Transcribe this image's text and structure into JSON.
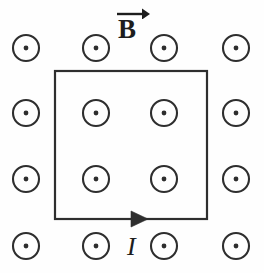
{
  "figure": {
    "name": "current-carrying-square-loop-in-uniform-magnetic-field",
    "width": 264,
    "height": 273,
    "background_color": "#fefefe",
    "ink_color": "#2e2e2e",
    "text_color": "#1d1d1d"
  },
  "labels": {
    "magnetic_field": "B",
    "magnetic_field_icon": "vector-arrow-overline",
    "current": "I"
  },
  "field_label_position": {
    "x": 132,
    "y": 28
  },
  "current_label_position": {
    "x": 134,
    "y": 248
  },
  "loop": {
    "shape": "square",
    "left": 55,
    "top": 71,
    "right": 207,
    "bottom": 219,
    "stroke_width": 2.2,
    "current_direction": "clockwise-arrow-on-bottom-edge-pointing-right",
    "arrowhead": {
      "tip_x": 148,
      "y": 219,
      "half_height": 8,
      "length": 17
    }
  },
  "field_symbol": {
    "type": "dot-in-circle",
    "meaning": "magnetic-field-out-of-page",
    "outer_radius": 13,
    "inner_radius": 2.4,
    "columns_x": [
      26,
      96,
      164,
      236
    ],
    "rows_y": [
      48,
      113,
      179,
      246
    ],
    "count": 16,
    "inside_loop_count": 4,
    "outside_loop_count": 12
  },
  "field_dots": [
    {
      "id": "dot-r1c1",
      "x": 26,
      "y": 48,
      "inside_loop": false
    },
    {
      "id": "dot-r1c2",
      "x": 96,
      "y": 48,
      "inside_loop": false
    },
    {
      "id": "dot-r1c3",
      "x": 164,
      "y": 48,
      "inside_loop": false
    },
    {
      "id": "dot-r1c4",
      "x": 236,
      "y": 48,
      "inside_loop": false
    },
    {
      "id": "dot-r2c1",
      "x": 26,
      "y": 113,
      "inside_loop": false
    },
    {
      "id": "dot-r2c2",
      "x": 96,
      "y": 113,
      "inside_loop": true
    },
    {
      "id": "dot-r2c3",
      "x": 164,
      "y": 113,
      "inside_loop": true
    },
    {
      "id": "dot-r2c4",
      "x": 236,
      "y": 113,
      "inside_loop": false
    },
    {
      "id": "dot-r3c1",
      "x": 26,
      "y": 179,
      "inside_loop": false
    },
    {
      "id": "dot-r3c2",
      "x": 96,
      "y": 179,
      "inside_loop": true
    },
    {
      "id": "dot-r3c3",
      "x": 164,
      "y": 179,
      "inside_loop": true
    },
    {
      "id": "dot-r3c4",
      "x": 236,
      "y": 179,
      "inside_loop": false
    },
    {
      "id": "dot-r4c1",
      "x": 26,
      "y": 246,
      "inside_loop": false
    },
    {
      "id": "dot-r4c2",
      "x": 96,
      "y": 246,
      "inside_loop": false
    },
    {
      "id": "dot-r4c3",
      "x": 164,
      "y": 246,
      "inside_loop": false
    },
    {
      "id": "dot-r4c4",
      "x": 236,
      "y": 246,
      "inside_loop": false
    }
  ]
}
